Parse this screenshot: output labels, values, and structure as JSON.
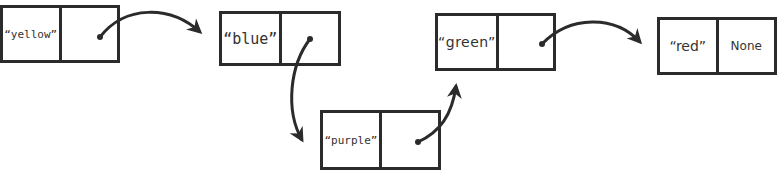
{
  "diagram": {
    "type": "linked-list",
    "stroke_color": "#2b2b2b",
    "nodes": [
      {
        "value": "“yellow”",
        "next": ""
      },
      {
        "value": "“blue”",
        "next": ""
      },
      {
        "value": "“purple”",
        "next": ""
      },
      {
        "value": "“green”",
        "next": ""
      },
      {
        "value": "“red”",
        "next": "None"
      }
    ],
    "edges": [
      {
        "from": "yellow",
        "to": "blue"
      },
      {
        "from": "blue",
        "to": "purple"
      },
      {
        "from": "purple",
        "to": "green"
      },
      {
        "from": "green",
        "to": "red"
      }
    ]
  }
}
